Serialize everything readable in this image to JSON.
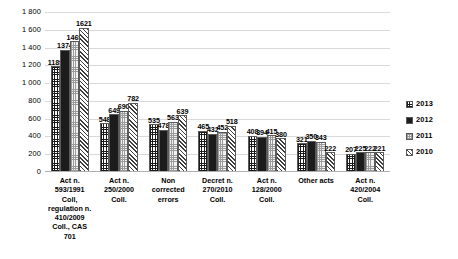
{
  "chart_data": {
    "type": "bar",
    "title": "",
    "subtitle": "",
    "xlabel": "",
    "ylabel": "",
    "ylim": [
      0,
      1800
    ],
    "ytick_step": 200,
    "ytick_labels": [
      "1 800",
      "1 600",
      "1 400",
      "1 200",
      "1 000",
      "800",
      "600",
      "400",
      "200",
      "0"
    ],
    "ytick_values": [
      1800,
      1600,
      1400,
      1200,
      1000,
      800,
      600,
      400,
      200,
      0
    ],
    "grid": true,
    "legend_position": "right",
    "data_labels": true,
    "categories": [
      "Act n.\n593/1991\nColl,\nregulation n.\n410/2009\nColl., CAS 701",
      "Act n.\n250/2000\nColl.",
      "Non\ncorrected\nerrors",
      "Decret n.\n270/2010\nColl.",
      "Act n.\n128/2000\nColl.",
      "Other acts",
      "Act n.\n420/2004\nColl."
    ],
    "series": [
      {
        "name": "2013",
        "pattern": "grid-crosshatch",
        "values": [
          1189,
          548,
          535,
          465,
          408,
          321,
          207
        ]
      },
      {
        "name": "2012",
        "pattern": "solid-black",
        "values": [
          1374,
          649,
          478,
          432,
          394,
          350,
          225
        ]
      },
      {
        "name": "2011",
        "pattern": "light-dotted",
        "values": [
          1469,
          690,
          563,
          452,
          415,
          343,
          222
        ]
      },
      {
        "name": "2010",
        "pattern": "diagonal-hatch",
        "values": [
          1621,
          782,
          639,
          518,
          380,
          222,
          221
        ]
      }
    ]
  },
  "legend": {
    "items": [
      {
        "label": "2013"
      },
      {
        "label": "2012"
      },
      {
        "label": "2011"
      },
      {
        "label": "2010"
      }
    ]
  }
}
